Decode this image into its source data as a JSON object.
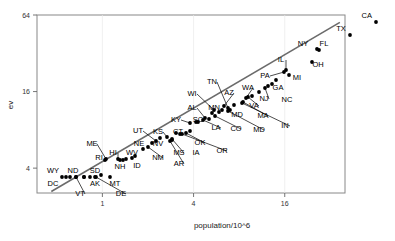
{
  "chart_data": {
    "type": "scatter",
    "title": "",
    "xlabel": "population/10^6",
    "ylabel": "ev",
    "xscale": "log",
    "yscale": "log",
    "grid": false,
    "legend": null,
    "xticks": [
      1,
      4,
      16
    ],
    "xticklabels": [
      "1",
      "4",
      "16"
    ],
    "yticks": [
      4,
      16,
      64
    ],
    "yticklabels": [
      "4",
      "16",
      "64"
    ],
    "xlim": [
      0.37,
      40
    ],
    "ylim": [
      2.55,
      64
    ],
    "fit_line": {
      "x": [
        0.46,
        37.0
      ],
      "y": [
        2.62,
        56.0
      ],
      "color": "#6b6b6b"
    },
    "point_label": "state",
    "points": [
      {
        "label": "CA",
        "x": 33.9,
        "y": 54
      },
      {
        "label": "TX",
        "x": 20.9,
        "y": 34
      },
      {
        "label": "NY",
        "x": 19.0,
        "y": 31
      },
      {
        "label": "FL",
        "x": 16.0,
        "y": 27
      },
      {
        "label": "OH",
        "x": 11.4,
        "y": 21
      },
      {
        "label": "IL",
        "x": 12.4,
        "y": 22
      },
      {
        "label": "PA",
        "x": 12.3,
        "y": 21
      },
      {
        "label": "MI",
        "x": 9.9,
        "y": 18
      },
      {
        "label": "NC",
        "x": 8.0,
        "y": 15
      },
      {
        "label": "GA",
        "x": 8.2,
        "y": 15
      },
      {
        "label": "NJ",
        "x": 8.4,
        "y": 15
      },
      {
        "label": "VA",
        "x": 7.1,
        "y": 13
      },
      {
        "label": "WA",
        "x": 5.9,
        "y": 11
      },
      {
        "label": "AZ",
        "x": 5.1,
        "y": 10
      },
      {
        "label": "MA",
        "x": 6.3,
        "y": 12
      },
      {
        "label": "IN",
        "x": 6.1,
        "y": 12
      },
      {
        "label": "TN",
        "x": 5.7,
        "y": 11
      },
      {
        "label": "MO",
        "x": 5.6,
        "y": 11
      },
      {
        "label": "MD",
        "x": 5.3,
        "y": 10
      },
      {
        "label": "WI",
        "x": 5.4,
        "y": 11
      },
      {
        "label": "MN",
        "x": 4.9,
        "y": 10
      },
      {
        "label": "CO",
        "x": 4.3,
        "y": 9
      },
      {
        "label": "AL",
        "x": 4.4,
        "y": 9
      },
      {
        "label": "LA",
        "x": 4.5,
        "y": 9
      },
      {
        "label": "SC",
        "x": 4.0,
        "y": 8
      },
      {
        "label": "KY",
        "x": 4.0,
        "y": 8
      },
      {
        "label": "OR",
        "x": 3.4,
        "y": 7
      },
      {
        "label": "OK",
        "x": 3.5,
        "y": 8
      },
      {
        "label": "CT",
        "x": 3.4,
        "y": 8
      },
      {
        "label": "IA",
        "x": 2.9,
        "y": 7
      },
      {
        "label": "MS",
        "x": 2.8,
        "y": 7
      },
      {
        "label": "AR",
        "x": 2.7,
        "y": 6
      },
      {
        "label": "KS",
        "x": 2.7,
        "y": 6
      },
      {
        "label": "UT",
        "x": 2.2,
        "y": 5
      },
      {
        "label": "NV",
        "x": 2.0,
        "y": 5
      },
      {
        "label": "NM",
        "x": 1.8,
        "y": 5
      },
      {
        "label": "NE",
        "x": 1.7,
        "y": 5
      },
      {
        "label": "WV",
        "x": 1.8,
        "y": 5
      },
      {
        "label": "ID",
        "x": 1.3,
        "y": 4
      },
      {
        "label": "NH",
        "x": 1.2,
        "y": 4
      },
      {
        "label": "HI",
        "x": 1.2,
        "y": 4
      },
      {
        "label": "ME",
        "x": 1.3,
        "y": 4
      },
      {
        "label": "RI",
        "x": 1.0,
        "y": 4
      },
      {
        "label": "MT",
        "x": 0.9,
        "y": 3
      },
      {
        "label": "SD",
        "x": 0.75,
        "y": 3
      },
      {
        "label": "DE",
        "x": 0.78,
        "y": 3
      },
      {
        "label": "ND",
        "x": 0.64,
        "y": 3
      },
      {
        "label": "AK",
        "x": 0.63,
        "y": 3
      },
      {
        "label": "VT",
        "x": 0.61,
        "y": 3
      },
      {
        "label": "WY",
        "x": 0.49,
        "y": 3
      },
      {
        "label": "DC",
        "x": 0.52,
        "y": 3
      }
    ],
    "labels_layout": [
      {
        "label": "CA",
        "lx": 372,
        "ly": 18,
        "px": 376,
        "py": 22,
        "anchor": "end",
        "leader": false
      },
      {
        "label": "TX",
        "lx": 341,
        "ly": 31,
        "px": 350,
        "py": 35,
        "anchor": "middle",
        "leader": false
      },
      {
        "label": "NY",
        "lx": 303,
        "ly": 46,
        "px": 317,
        "py": 49,
        "anchor": "middle",
        "leader": false
      },
      {
        "label": "FL",
        "lx": 324,
        "ly": 46,
        "px": 319,
        "py": 50,
        "anchor": "middle",
        "leader": false
      },
      {
        "label": "OH",
        "lx": 318,
        "ly": 67,
        "px": 312,
        "py": 62,
        "anchor": "middle",
        "leader": false
      },
      {
        "label": "IL",
        "lx": 281,
        "ly": 62,
        "px": 286,
        "py": 70,
        "anchor": "middle",
        "leader": true
      },
      {
        "label": "PA",
        "lx": 265,
        "ly": 78,
        "px": 284,
        "py": 72,
        "anchor": "middle",
        "leader": true
      },
      {
        "label": "MI",
        "lx": 297,
        "ly": 80,
        "px": 289,
        "py": 75,
        "anchor": "middle",
        "leader": false
      },
      {
        "label": "GA",
        "lx": 278,
        "ly": 90,
        "px": 272,
        "py": 84,
        "anchor": "middle",
        "leader": false
      },
      {
        "label": "NC",
        "lx": 287,
        "ly": 102,
        "px": 268,
        "py": 86,
        "anchor": "middle",
        "leader": false
      },
      {
        "label": "NJ",
        "lx": 264,
        "ly": 101,
        "px": 265,
        "py": 88,
        "anchor": "middle",
        "leader": true
      },
      {
        "label": "WA",
        "lx": 248,
        "ly": 90,
        "px": 246,
        "py": 98,
        "anchor": "middle",
        "leader": true
      },
      {
        "label": "VA",
        "lx": 254,
        "ly": 108,
        "px": 248,
        "py": 97,
        "anchor": "middle",
        "leader": true
      },
      {
        "label": "AZ",
        "lx": 229,
        "ly": 95,
        "px": 224,
        "py": 106,
        "anchor": "middle",
        "leader": true
      },
      {
        "label": "MA",
        "lx": 263,
        "ly": 118,
        "px": 243,
        "py": 102,
        "anchor": "middle",
        "leader": true
      },
      {
        "label": "IN",
        "lx": 285,
        "ly": 128,
        "px": 242,
        "py": 103,
        "anchor": "middle",
        "leader": true
      },
      {
        "label": "TN",
        "lx": 212,
        "ly": 84,
        "px": 228,
        "py": 108,
        "anchor": "middle",
        "leader": true
      },
      {
        "label": "MD",
        "lx": 237,
        "ly": 117,
        "px": 230,
        "py": 110,
        "anchor": "middle",
        "leader": false
      },
      {
        "label": "MD2",
        "lx": 259,
        "ly": 132,
        "px": 228,
        "py": 111,
        "anchor": "middle",
        "leader": true
      },
      {
        "label": "WI",
        "lx": 192,
        "ly": 96,
        "px": 214,
        "py": 110,
        "anchor": "middle",
        "leader": true
      },
      {
        "label": "MN",
        "lx": 214,
        "ly": 110,
        "px": 219,
        "py": 112,
        "anchor": "middle",
        "leader": false
      },
      {
        "label": "CO",
        "lx": 236,
        "ly": 131,
        "px": 215,
        "py": 116,
        "anchor": "middle",
        "leader": true
      },
      {
        "label": "AL",
        "lx": 192,
        "ly": 110,
        "px": 205,
        "py": 118,
        "anchor": "middle",
        "leader": true
      },
      {
        "label": "LA",
        "lx": 216,
        "ly": 130,
        "px": 203,
        "py": 120,
        "anchor": "middle",
        "leader": true
      },
      {
        "label": "SC",
        "lx": 198,
        "ly": 122,
        "px": 196,
        "py": 122,
        "anchor": "middle",
        "leader": false
      },
      {
        "label": "KY",
        "lx": 176,
        "ly": 122,
        "px": 190,
        "py": 123,
        "anchor": "middle",
        "leader": true
      },
      {
        "label": "OK",
        "lx": 200,
        "ly": 145,
        "px": 186,
        "py": 133,
        "anchor": "middle",
        "leader": true
      },
      {
        "label": "OR",
        "lx": 222,
        "ly": 153,
        "px": 182,
        "py": 134,
        "anchor": "middle",
        "leader": true
      },
      {
        "label": "CT",
        "lx": 178,
        "ly": 134,
        "px": 176,
        "py": 133,
        "anchor": "middle",
        "leader": false
      },
      {
        "label": "IA",
        "lx": 196,
        "ly": 155,
        "px": 172,
        "py": 140,
        "anchor": "middle",
        "leader": false
      },
      {
        "label": "MS",
        "lx": 179,
        "ly": 155,
        "px": 172,
        "py": 139,
        "anchor": "middle",
        "leader": true
      },
      {
        "label": "AR",
        "lx": 179,
        "ly": 166,
        "px": 170,
        "py": 141,
        "anchor": "middle",
        "leader": true
      },
      {
        "label": "KS",
        "lx": 158,
        "ly": 134,
        "px": 167,
        "py": 137,
        "anchor": "middle",
        "leader": true
      },
      {
        "label": "UT",
        "lx": 138,
        "ly": 133,
        "px": 156,
        "py": 141,
        "anchor": "middle",
        "leader": true
      },
      {
        "label": "NV",
        "lx": 158,
        "ly": 146,
        "px": 152,
        "py": 143,
        "anchor": "middle",
        "leader": false
      },
      {
        "label": "NM",
        "lx": 158,
        "ly": 160,
        "px": 148,
        "py": 147,
        "anchor": "middle",
        "leader": true
      },
      {
        "label": "NE",
        "lx": 139,
        "ly": 146,
        "px": 143,
        "py": 149,
        "anchor": "middle",
        "leader": false
      },
      {
        "label": "WV",
        "lx": 132,
        "ly": 155,
        "px": 135,
        "py": 156,
        "anchor": "middle",
        "leader": false
      },
      {
        "label": "ID",
        "lx": 137,
        "ly": 168,
        "px": 132,
        "py": 158,
        "anchor": "middle",
        "leader": false
      },
      {
        "label": "NH",
        "lx": 120,
        "ly": 169,
        "px": 120,
        "py": 160,
        "anchor": "middle",
        "leader": false
      },
      {
        "label": "HI",
        "lx": 113,
        "ly": 155,
        "px": 118,
        "py": 159,
        "anchor": "middle",
        "leader": true
      },
      {
        "label": "ME",
        "lx": 92,
        "ly": 146,
        "px": 106,
        "py": 159,
        "anchor": "middle",
        "leader": true
      },
      {
        "label": "RI",
        "lx": 99,
        "ly": 160,
        "px": 105,
        "py": 160,
        "anchor": "middle",
        "leader": false
      },
      {
        "label": "MT",
        "lx": 115,
        "ly": 186,
        "px": 101,
        "py": 175,
        "anchor": "middle",
        "leader": false
      },
      {
        "label": "SD",
        "lx": 95,
        "ly": 173,
        "px": 95,
        "py": 177,
        "anchor": "middle",
        "leader": false
      },
      {
        "label": "DE",
        "lx": 121,
        "ly": 196,
        "px": 96,
        "py": 177,
        "anchor": "middle",
        "leader": true
      },
      {
        "label": "ND",
        "lx": 73,
        "ly": 173,
        "px": 84,
        "py": 177,
        "anchor": "middle",
        "leader": false
      },
      {
        "label": "AK",
        "lx": 95,
        "ly": 186,
        "px": 84,
        "py": 177,
        "anchor": "middle",
        "leader": false
      },
      {
        "label": "VT",
        "lx": 80,
        "ly": 196,
        "px": 76,
        "py": 177,
        "anchor": "middle",
        "leader": true
      },
      {
        "label": "WY",
        "lx": 53,
        "ly": 173,
        "px": 62,
        "py": 177,
        "anchor": "middle",
        "leader": false
      },
      {
        "label": "DC",
        "lx": 53,
        "ly": 186,
        "px": 66,
        "py": 177,
        "anchor": "middle",
        "leader": false
      }
    ],
    "extra_points": [
      {
        "x": 70,
        "y": 177
      },
      {
        "x": 76,
        "y": 177
      },
      {
        "x": 90,
        "y": 177
      },
      {
        "x": 110,
        "y": 177
      },
      {
        "x": 123,
        "y": 160
      },
      {
        "x": 126,
        "y": 159
      },
      {
        "x": 160,
        "y": 138
      },
      {
        "x": 180,
        "y": 134
      },
      {
        "x": 190,
        "y": 131
      },
      {
        "x": 198,
        "y": 122
      },
      {
        "x": 209,
        "y": 119
      },
      {
        "x": 212,
        "y": 113
      },
      {
        "x": 222,
        "y": 110
      },
      {
        "x": 234,
        "y": 105
      },
      {
        "x": 252,
        "y": 96
      },
      {
        "x": 259,
        "y": 92
      },
      {
        "x": 276,
        "y": 80
      }
    ]
  },
  "axes": {
    "x_title": "population/10^6",
    "y_title": "ev"
  }
}
